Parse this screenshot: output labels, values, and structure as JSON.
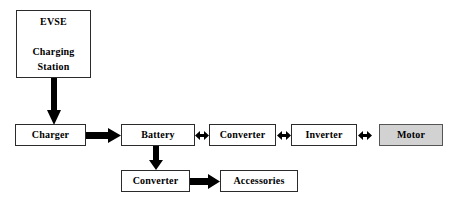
{
  "diagram": {
    "background_color": "#ffffff",
    "line_color": "#000000",
    "box_border_color": "#2b2b2b",
    "highlight_fill_color": "#d2d2d2",
    "nodes": [
      {
        "id": "evse",
        "label": "EVSE\n\nCharging\nStation",
        "filled": false,
        "x": 16,
        "y": 10,
        "width": 75,
        "height": 68
      },
      {
        "id": "charger",
        "label": "Charger",
        "filled": false,
        "x": 15,
        "y": 124,
        "width": 71,
        "height": 22
      },
      {
        "id": "battery",
        "label": "Battery",
        "filled": false,
        "x": 121,
        "y": 124,
        "width": 74,
        "height": 22
      },
      {
        "id": "converter-hv",
        "label": "Converter",
        "filled": false,
        "x": 209,
        "y": 124,
        "width": 67,
        "height": 22
      },
      {
        "id": "inverter",
        "label": "Inverter",
        "filled": false,
        "x": 291,
        "y": 124,
        "width": 66,
        "height": 22
      },
      {
        "id": "motor",
        "label": "Motor",
        "filled": true,
        "x": 379,
        "y": 124,
        "width": 64,
        "height": 22
      },
      {
        "id": "converter-lv",
        "label": "Converter",
        "filled": false,
        "x": 121,
        "y": 170,
        "width": 69,
        "height": 22
      },
      {
        "id": "accessories",
        "label": "Accessories",
        "filled": false,
        "x": 220,
        "y": 170,
        "width": 78,
        "height": 22
      }
    ],
    "edges": [
      {
        "id": "evse-to-charger",
        "from": "evse",
        "to": "charger",
        "direction": "down",
        "style": "thick-block",
        "bidirectional": false
      },
      {
        "id": "charger-to-battery",
        "from": "charger",
        "to": "battery",
        "direction": "right",
        "style": "thick-block",
        "bidirectional": false
      },
      {
        "id": "battery-to-converter-hv",
        "from": "battery",
        "to": "converter-hv",
        "direction": "horizontal",
        "style": "short-double",
        "bidirectional": true
      },
      {
        "id": "converter-hv-to-inverter",
        "from": "converter-hv",
        "to": "inverter",
        "direction": "horizontal",
        "style": "short-double",
        "bidirectional": true
      },
      {
        "id": "inverter-to-motor",
        "from": "inverter",
        "to": "motor",
        "direction": "horizontal",
        "style": "short-double",
        "bidirectional": true
      },
      {
        "id": "battery-to-converter-lv",
        "from": "battery",
        "to": "converter-lv",
        "direction": "down",
        "style": "thick-block",
        "bidirectional": false
      },
      {
        "id": "converter-lv-to-accessories",
        "from": "converter-lv",
        "to": "accessories",
        "direction": "right",
        "style": "thick-block",
        "bidirectional": false
      }
    ]
  }
}
